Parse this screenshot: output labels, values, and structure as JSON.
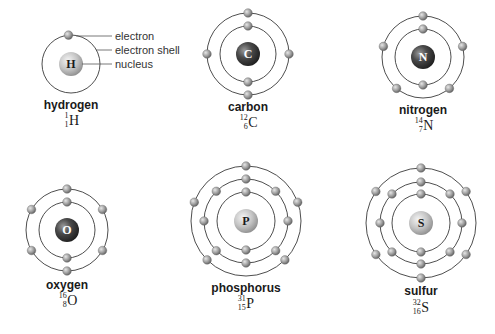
{
  "colors": {
    "shell": "#3a3a3a",
    "electron": "#9a9a9a",
    "nucleus_dark": "#3c3c3c",
    "nucleus_light": "#bdbdbd"
  },
  "key": {
    "electron": "electron",
    "electron_shell": "electron shell",
    "nucleus": "nucleus"
  },
  "atoms": [
    {
      "name": "hydrogen",
      "symbol": "H",
      "mass": "1",
      "atomic_number": "1",
      "nucleus_style": "light",
      "cx": 71,
      "cy": 64,
      "shells": [
        {
          "r": 29,
          "angles": [
            95
          ]
        }
      ],
      "label_y": 109,
      "iso_y": 124
    },
    {
      "name": "carbon",
      "symbol": "C",
      "mass": "12",
      "atomic_number": "6",
      "nucleus_style": "dark",
      "cx": 248,
      "cy": 54,
      "shells": [
        {
          "r": 28,
          "angles": [
            90,
            270
          ]
        },
        {
          "r": 41,
          "angles": [
            90,
            180,
            0,
            270
          ]
        }
      ],
      "label_y": 111,
      "iso_y": 126
    },
    {
      "name": "nitrogen",
      "symbol": "N",
      "mass": "14",
      "atomic_number": "7",
      "nucleus_style": "dark",
      "cx": 423,
      "cy": 57,
      "shells": [
        {
          "r": 28,
          "angles": [
            90,
            270
          ]
        },
        {
          "r": 41,
          "angles": [
            90,
            165,
            15,
            230,
            310
          ]
        }
      ],
      "label_y": 114,
      "iso_y": 129
    },
    {
      "name": "oxygen",
      "symbol": "O",
      "mass": "16",
      "atomic_number": "8",
      "nucleus_style": "dark",
      "cx": 67,
      "cy": 230,
      "shells": [
        {
          "r": 28,
          "angles": [
            90,
            270
          ]
        },
        {
          "r": 41,
          "angles": [
            90,
            150,
            30,
            210,
            330,
            270
          ]
        }
      ],
      "label_y": 289,
      "iso_y": 304
    },
    {
      "name": "phosphorus",
      "symbol": "P",
      "mass": "31",
      "atomic_number": "15",
      "nucleus_style": "light",
      "cx": 246,
      "cy": 221,
      "shells": [
        {
          "r": 29,
          "angles": [
            90,
            270
          ]
        },
        {
          "r": 42,
          "angles": [
            90,
            135,
            45,
            180,
            0,
            225,
            315,
            270
          ]
        },
        {
          "r": 55,
          "angles": [
            90,
            160,
            20,
            225,
            315
          ]
        }
      ],
      "label_y": 292,
      "iso_y": 307
    },
    {
      "name": "sulfur",
      "symbol": "S",
      "mass": "32",
      "atomic_number": "16",
      "nucleus_style": "light",
      "cx": 421,
      "cy": 223,
      "shells": [
        {
          "r": 29,
          "angles": [
            90,
            270
          ]
        },
        {
          "r": 41,
          "angles": [
            90,
            135,
            45,
            180,
            0,
            225,
            315,
            270
          ]
        },
        {
          "r": 55,
          "angles": [
            90,
            145,
            35,
            215,
            325,
            270
          ]
        }
      ],
      "label_y": 295,
      "iso_y": 311
    }
  ]
}
